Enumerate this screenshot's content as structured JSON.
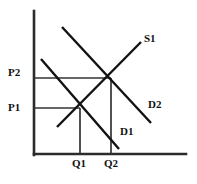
{
  "figure": {
    "kind": "supply-demand-diagram",
    "background_color": "#ffffff",
    "line_color": "#121212",
    "axis_color": "#2b2b2b",
    "guide_color": "#333333"
  },
  "axes": {
    "y_axis": {
      "name": "price-axis",
      "x": 34,
      "y_top": 11,
      "y_bottom": 155
    },
    "x_axis": {
      "name": "quantity-axis",
      "y": 154,
      "x_left": 34,
      "x_right": 186
    }
  },
  "curves": [
    {
      "id": "supply",
      "label": "S1",
      "label_x": 144,
      "label_y": 33,
      "x1": 57,
      "y1": 127,
      "x2": 141,
      "y2": 42
    },
    {
      "id": "demand-1",
      "label": "D1",
      "label_x": 120,
      "label_y": 126,
      "x1": 41,
      "y1": 59,
      "x2": 119,
      "y2": 149
    },
    {
      "id": "demand-2",
      "label": "D2",
      "label_x": 148,
      "label_y": 99,
      "x1": 62,
      "y1": 27,
      "x2": 151,
      "y2": 123
    }
  ],
  "equilibria": [
    {
      "id": "equilibrium-1",
      "x": 80,
      "y": 108,
      "price_label": "P1",
      "price_label_x": 8,
      "price_label_y": 102,
      "quantity_label": "Q1",
      "quantity_label_x": 72,
      "quantity_label_y": 158
    },
    {
      "id": "equilibrium-2",
      "x": 111,
      "y": 78,
      "price_label": "P2",
      "price_label_x": 8,
      "price_label_y": 67,
      "quantity_label": "Q2",
      "quantity_label_x": 104,
      "quantity_label_y": 158
    }
  ],
  "chart_data": {
    "type": "line",
    "title": "",
    "xlabel": "",
    "ylabel": "",
    "grid": false,
    "legend": "inline-curve-labels",
    "series": [
      {
        "name": "S1",
        "role": "supply",
        "slope": "upward"
      },
      {
        "name": "D1",
        "role": "demand-initial",
        "slope": "downward"
      },
      {
        "name": "D2",
        "role": "demand-shifted-right",
        "slope": "downward"
      }
    ],
    "tick_labels": {
      "y": [
        "P1",
        "P2"
      ],
      "x": [
        "Q1",
        "Q2"
      ]
    },
    "annotations": [
      "Equilibrium 1 at (Q1, P1) where S1 meets D1",
      "Equilibrium 2 at (Q2, P2) where S1 meets D2"
    ]
  }
}
